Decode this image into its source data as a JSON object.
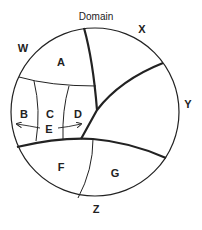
{
  "diagram": {
    "title": "Domain",
    "outer_labels": {
      "w": "W",
      "x": "X",
      "y": "Y",
      "z": "Z"
    },
    "regions": {
      "a": "A",
      "b": "B",
      "c": "C",
      "d": "D",
      "e": "E",
      "f": "F",
      "g": "G"
    },
    "colors": {
      "line": "#222222",
      "background": "#ffffff"
    }
  }
}
